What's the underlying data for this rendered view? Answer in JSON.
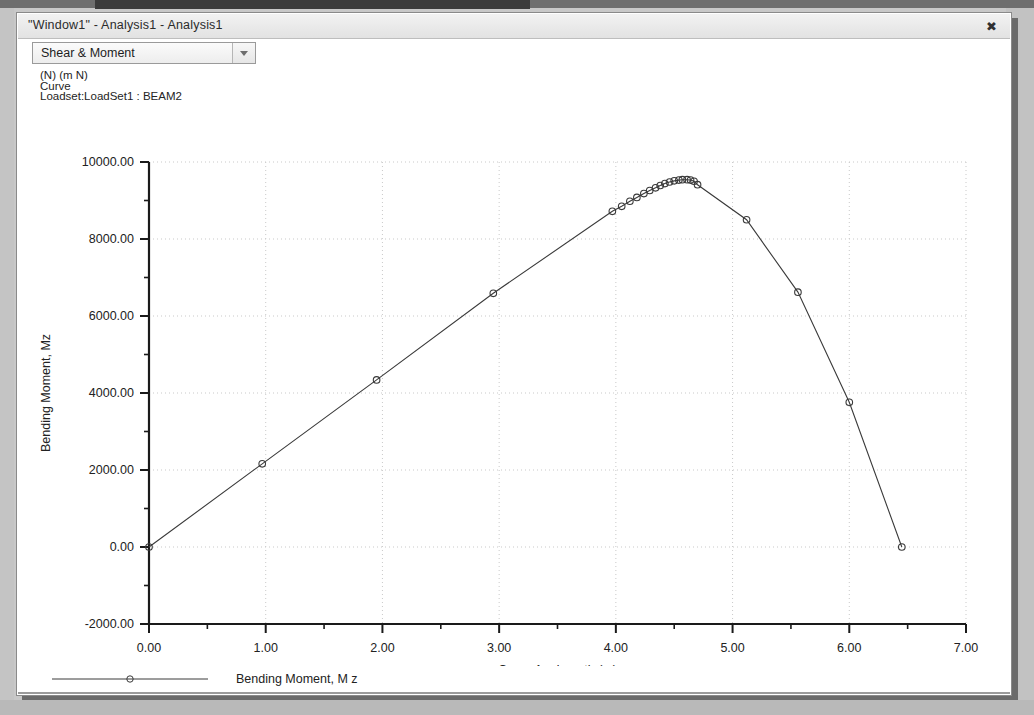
{
  "window": {
    "title": "\"Window1\" - Analysis1 - Analysis1",
    "close_icon": "close-icon",
    "close_glyph": "✖"
  },
  "toolbar": {
    "combo_value": "Shear & Moment",
    "combo_arrow_icon": "chevron-down-icon"
  },
  "caption": {
    "line1": "(N)  (m N)",
    "line2": "Curve",
    "line3": "Loadset:LoadSet1 :  BEAM2"
  },
  "legend": {
    "entries": [
      {
        "label": "Bending Moment, M z",
        "marker": "open-circle",
        "color": "#3a3a3a"
      }
    ]
  },
  "colors": {
    "line": "#3a3a3a",
    "marker_stroke": "#3a3a3a",
    "axis": "#1a1a1a",
    "grid": "#c9c9c9",
    "text": "#222222",
    "plot_bg": "#ffffff"
  },
  "chart_data": {
    "type": "line",
    "title": "",
    "xlabel": "Curve Arc Length (m)",
    "ylabel": "Bending Moment, Mz",
    "xlim": [
      0,
      7
    ],
    "ylim": [
      -2000,
      10000
    ],
    "xticks": [
      0,
      1,
      2,
      3,
      4,
      5,
      6,
      7
    ],
    "xticklabels": [
      "0.00",
      "1.00",
      "2.00",
      "3.00",
      "4.00",
      "5.00",
      "6.00",
      "7.00"
    ],
    "yticks": [
      -2000,
      0,
      2000,
      4000,
      6000,
      8000,
      10000
    ],
    "yticklabels": [
      "-2000.00",
      "0.00",
      "2000.00",
      "4000.00",
      "6000.00",
      "8000.00",
      "10000.00"
    ],
    "x_minor_step": 0.5,
    "y_minor_step": 1000,
    "grid": true,
    "grid_style": "dotted",
    "legend_position": "bottom-left",
    "series": [
      {
        "name": "Bending Moment, M z",
        "marker": "open-circle",
        "color": "#3a3a3a",
        "x": [
          0.0,
          0.97,
          1.95,
          2.95,
          3.97,
          4.05,
          4.12,
          4.18,
          4.24,
          4.29,
          4.34,
          4.38,
          4.42,
          4.46,
          4.5,
          4.54,
          4.57,
          4.61,
          4.64,
          4.67,
          4.7,
          5.12,
          5.56,
          6.0,
          6.45
        ],
        "y": [
          0,
          2160,
          4340,
          6590,
          8720,
          8850,
          8980,
          9080,
          9180,
          9260,
          9330,
          9390,
          9440,
          9480,
          9510,
          9530,
          9540,
          9540,
          9530,
          9500,
          9410,
          8500,
          6620,
          3760,
          0
        ]
      }
    ]
  }
}
